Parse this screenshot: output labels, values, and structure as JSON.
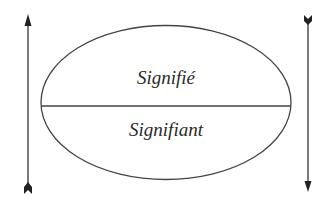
{
  "diagram": {
    "type": "saussure-sign",
    "top_label": "Signifié",
    "bottom_label": "Signifiant",
    "colors": {
      "stroke": "#444444",
      "text": "#2a2a2a",
      "background": "#ffffff"
    },
    "arrows": [
      {
        "side": "left",
        "direction": "up"
      },
      {
        "side": "right",
        "direction": "down"
      }
    ]
  }
}
